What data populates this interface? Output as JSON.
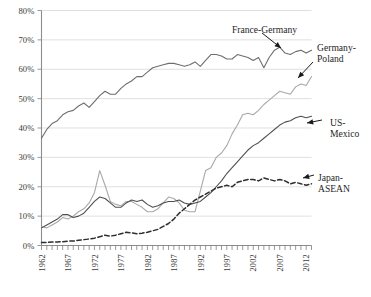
{
  "chart_data": {
    "type": "line",
    "title": "",
    "subtitle": "",
    "xlabel": "",
    "ylabel": "",
    "xlim": [
      1962,
      2013
    ],
    "ylim": [
      0,
      80
    ],
    "grid": true,
    "grid_axis": "y",
    "legend_position": "inline-annotations",
    "y_tick_labels": [
      "0%",
      "10%",
      "20%",
      "30%",
      "40%",
      "50%",
      "60%",
      "70%",
      "80%"
    ],
    "y_tick_values": [
      0,
      10,
      20,
      30,
      40,
      50,
      60,
      70,
      80
    ],
    "x_tick_labels": [
      "1962",
      "1967",
      "1972",
      "1977",
      "1982",
      "1987",
      "1992",
      "1997",
      "2002",
      "2007",
      "2012"
    ],
    "x_tick_values": [
      1962,
      1967,
      1972,
      1977,
      1982,
      1987,
      1992,
      1997,
      2002,
      2007,
      2012
    ],
    "x_minor_tick_interval": 1,
    "x": [
      1962,
      1963,
      1964,
      1965,
      1966,
      1967,
      1968,
      1969,
      1970,
      1971,
      1972,
      1973,
      1974,
      1975,
      1976,
      1977,
      1978,
      1979,
      1980,
      1981,
      1982,
      1983,
      1984,
      1985,
      1986,
      1987,
      1988,
      1989,
      1990,
      1991,
      1992,
      1993,
      1994,
      1995,
      1996,
      1997,
      1998,
      1999,
      2000,
      2001,
      2002,
      2003,
      2004,
      2005,
      2006,
      2007,
      2008,
      2009,
      2010,
      2011,
      2012,
      2013
    ],
    "series": [
      {
        "name": "France-Germany",
        "color": "#6e6e6e",
        "style": "solid",
        "values": [
          36.5,
          39.5,
          41.5,
          42.5,
          44.5,
          45.5,
          46.0,
          47.5,
          48.5,
          47.0,
          49.0,
          51.0,
          52.5,
          51.5,
          51.5,
          53.5,
          55.0,
          56.0,
          57.5,
          57.5,
          59.0,
          60.5,
          61.0,
          61.5,
          62.0,
          62.0,
          61.5,
          61.0,
          61.5,
          62.5,
          61.0,
          63.0,
          65.0,
          65.0,
          64.5,
          63.5,
          63.5,
          65.0,
          64.5,
          64.0,
          63.0,
          64.0,
          60.5,
          64.0,
          66.5,
          67.5,
          65.5,
          65.0,
          66.0,
          66.5,
          65.5,
          66.5
        ]
      },
      {
        "name": "Germany-Poland",
        "color": "#a8a8a8",
        "style": "solid",
        "values": [
          6.5,
          6.0,
          7.0,
          8.0,
          9.5,
          9.0,
          10.0,
          11.5,
          12.5,
          14.5,
          18.0,
          25.5,
          20.5,
          15.0,
          14.0,
          13.5,
          15.0,
          15.0,
          14.0,
          13.0,
          11.5,
          11.5,
          12.5,
          14.5,
          16.5,
          16.0,
          14.5,
          12.0,
          11.5,
          11.5,
          18.5,
          25.5,
          26.5,
          30.0,
          31.5,
          34.0,
          38.0,
          41.0,
          44.5,
          45.0,
          44.5,
          46.0,
          48.0,
          49.5,
          51.0,
          52.5,
          52.0,
          51.5,
          54.0,
          55.0,
          54.5,
          57.5
        ]
      },
      {
        "name": "US-Mexico",
        "color": "#4f4f4f",
        "style": "solid",
        "values": [
          6.0,
          7.0,
          8.0,
          9.0,
          10.5,
          10.5,
          9.5,
          10.0,
          11.0,
          13.0,
          15.0,
          16.5,
          16.0,
          14.5,
          13.0,
          13.0,
          14.5,
          15.5,
          15.0,
          15.5,
          14.0,
          13.0,
          13.5,
          14.5,
          15.0,
          15.0,
          15.5,
          14.5,
          14.0,
          14.5,
          15.0,
          16.5,
          18.0,
          20.0,
          22.0,
          24.5,
          26.5,
          28.5,
          30.5,
          32.5,
          34.0,
          35.0,
          36.5,
          38.0,
          39.5,
          41.0,
          42.0,
          42.5,
          43.5,
          44.0,
          43.5,
          44.0
        ]
      },
      {
        "name": "Japan-ASEAN",
        "color": "#2e2e2e",
        "style": "dashed",
        "values": [
          1.0,
          1.0,
          1.2,
          1.2,
          1.3,
          1.5,
          1.5,
          1.8,
          2.0,
          2.2,
          2.5,
          3.0,
          3.5,
          3.2,
          3.5,
          4.0,
          4.5,
          4.3,
          4.0,
          4.2,
          4.5,
          5.0,
          5.5,
          6.5,
          7.5,
          9.0,
          11.0,
          12.5,
          14.0,
          15.5,
          16.5,
          17.5,
          18.5,
          19.5,
          20.0,
          20.5,
          20.0,
          21.5,
          22.0,
          22.5,
          22.5,
          22.0,
          23.0,
          22.5,
          22.0,
          22.5,
          22.0,
          21.0,
          21.5,
          21.0,
          20.5,
          21.0
        ]
      }
    ],
    "annotations": [
      {
        "id": "france-germany",
        "text": "France-Germany",
        "lines": [
          "France-Germany"
        ],
        "points_to_year": 2005,
        "points_to_value": 65
      },
      {
        "id": "germany-poland",
        "text": "Germany-Poland",
        "lines": [
          "Germany-",
          "Poland"
        ],
        "points_to_year": 2010,
        "points_to_value": 54
      },
      {
        "id": "us-mexico",
        "text": "US-Mexico",
        "lines": [
          "US-",
          "Mexico"
        ],
        "points_to_year": 2011,
        "points_to_value": 44
      },
      {
        "id": "japan-asean",
        "text": "Japan-ASEAN",
        "lines": [
          "Japan-",
          "ASEAN"
        ],
        "points_to_year": 2011,
        "points_to_value": 21
      }
    ]
  },
  "colors": {
    "background": "#ffffff",
    "gridline": "#d2d2d2",
    "axis": "#8d8d8d",
    "text": "#2b2b2b",
    "france_germany": "#6e6e6e",
    "germany_poland": "#a8a8a8",
    "us_mexico": "#4f4f4f",
    "japan_asean": "#2e2e2e"
  }
}
